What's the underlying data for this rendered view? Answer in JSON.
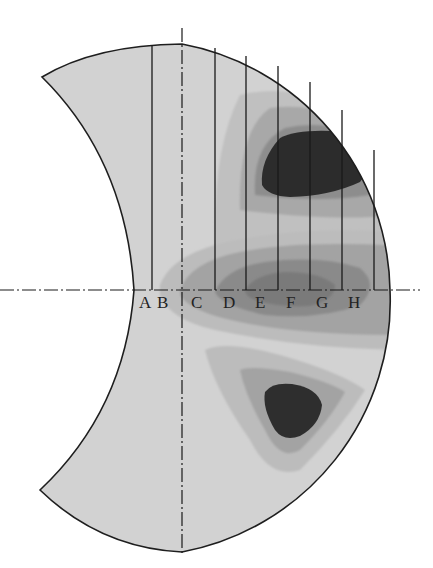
{
  "figure": {
    "type": "contour-map-crescent",
    "section_labels": [
      "A",
      "B",
      "C",
      "D",
      "E",
      "F",
      "G",
      "H"
    ],
    "colors": {
      "background": "#ffffff",
      "base_fill": "#d2d2d2",
      "level_1": "#bcbcbc",
      "level_2": "#a3a3a3",
      "level_3": "#8a8a8a",
      "level_4": "#2c2c2c",
      "outline": "#1e1e1e"
    },
    "axes": {
      "horizontal_centerline": "dash-dot",
      "vertical_centerline": "dash-dot"
    }
  }
}
